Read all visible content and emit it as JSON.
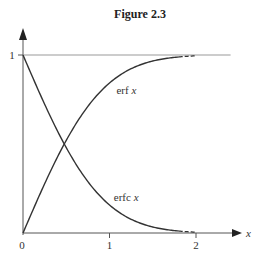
{
  "chart_data": {
    "type": "line",
    "title": "Figure 2.3",
    "xlabel": "x",
    "ylabel": "",
    "xlim": [
      0,
      2.5
    ],
    "ylim": [
      0,
      1.1
    ],
    "x_ticks": [
      {
        "value": 0,
        "label": "0"
      },
      {
        "value": 1,
        "label": "1"
      },
      {
        "value": 2,
        "label": "2"
      }
    ],
    "y_ticks": [
      {
        "value": 1,
        "label": "1"
      }
    ],
    "reference_lines": [
      {
        "axis": "y",
        "value": 1,
        "xmax": 2.4
      }
    ],
    "grid": false,
    "legend": "none",
    "series": [
      {
        "name": "erf x",
        "label": "erf x",
        "function": "erf",
        "x_range": [
          0,
          2.0
        ],
        "dashed_from": 1.8,
        "color": "#333333"
      },
      {
        "name": "erfc x",
        "label": "erfc x",
        "function": "erfc",
        "x_range": [
          0,
          2.0
        ],
        "dashed_from": 1.8,
        "color": "#333333"
      }
    ],
    "annotations": [
      {
        "text": "erf x",
        "x": 1.08,
        "y": 0.78
      },
      {
        "text": "erfc x",
        "x": 1.05,
        "y": 0.18
      }
    ]
  },
  "labels": {
    "title": "Figure 2.3",
    "x_axis_letter": "x",
    "origin": "0",
    "tick_1": "1",
    "tick_2": "2",
    "y_tick_1": "1",
    "erf": "erf x",
    "erfc": "erfc x"
  }
}
